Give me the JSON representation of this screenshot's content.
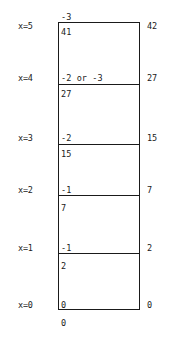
{
  "figure": {
    "type": "annotated-column-diagram",
    "box": {
      "left_px": 58,
      "top_px": 22,
      "width_px": 82,
      "height_px": 288
    },
    "levels": [
      {
        "axis_label": "x=5",
        "boundary_y_px": 22,
        "above_value": "-3",
        "below_value": "41",
        "right_value": "42"
      },
      {
        "axis_label": "x=4",
        "boundary_y_px": 84,
        "above_value": "-2 or -3",
        "below_value": "27",
        "right_value": "27"
      },
      {
        "axis_label": "x=3",
        "boundary_y_px": 144,
        "above_value": "-2",
        "below_value": "15",
        "right_value": "15"
      },
      {
        "axis_label": "x=2",
        "boundary_y_px": 195,
        "above_value": "-1",
        "below_value": "7",
        "right_value": "7"
      },
      {
        "axis_label": "x=1",
        "boundary_y_px": 253,
        "above_value": "-1",
        "below_value": "2",
        "right_value": "2"
      },
      {
        "axis_label": "x=0",
        "boundary_y_px": 310,
        "above_value": "0",
        "below_value": "0",
        "right_value": "0"
      }
    ],
    "colors": {
      "ink": "#1a1a1a",
      "background": "#ffffff"
    }
  }
}
